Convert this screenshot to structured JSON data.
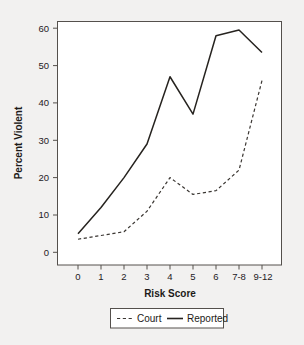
{
  "chart_data": {
    "type": "line",
    "title": "",
    "xlabel": "Risk Score",
    "ylabel": "Percent Violent",
    "categories": [
      "0",
      "1",
      "2",
      "3",
      "4",
      "5",
      "6",
      "7-8",
      "9-12"
    ],
    "yticks": [
      "0",
      "10",
      "20",
      "30",
      "40",
      "50",
      "60"
    ],
    "ylim": [
      -2,
      63
    ],
    "grid": false,
    "legend_position": "bottom-center",
    "series": [
      {
        "name": "Court",
        "style": "dashed",
        "color": "#3a3632",
        "values": [
          3.5,
          4.5,
          5.5,
          11.0,
          20.0,
          15.5,
          16.5,
          22.0,
          46.0
        ]
      },
      {
        "name": "Reported",
        "style": "solid",
        "color": "#26231f",
        "values": [
          5.0,
          12.0,
          20.0,
          29.0,
          47.0,
          37.0,
          58.0,
          59.5,
          53.5
        ]
      }
    ]
  },
  "legend": {
    "items": [
      {
        "label": "Court",
        "style": "dashed"
      },
      {
        "label": "Reported",
        "style": "solid"
      }
    ]
  },
  "colors": {
    "background": "#f2f1f0",
    "plot_background": "#ffffff",
    "frame": "#54504c",
    "ink": "#26231f"
  }
}
